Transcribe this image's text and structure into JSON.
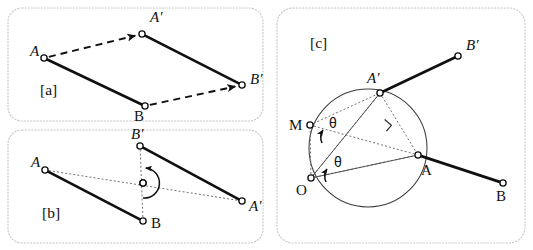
{
  "figure": {
    "background_color": "#ffffff",
    "line_color": "#101010",
    "frame_color": "#c8c8c8",
    "circle_color": "#3c3c3c"
  },
  "panels": [
    {
      "tag": "[a]",
      "name": "translation",
      "tag_pos": {
        "x": 40,
        "y": 95
      },
      "frame": {
        "x": 8,
        "y": 8,
        "width": 255,
        "height": 113,
        "rx": 14
      },
      "points": [
        {
          "id": "A",
          "label": "A",
          "x": 44,
          "y": 58,
          "label_x": 30,
          "label_y": 56,
          "italic": true
        },
        {
          "id": "Ap",
          "label": "A′",
          "x": 142,
          "y": 34,
          "label_x": 150,
          "label_y": 22,
          "italic": true
        },
        {
          "id": "B",
          "label": "B",
          "x": 145,
          "y": 106,
          "label_x": 134,
          "label_y": 121,
          "italic": false
        },
        {
          "id": "Bp",
          "label": "B′",
          "x": 242,
          "y": 85,
          "label_x": 250,
          "label_y": 84,
          "italic": true
        }
      ],
      "solid_segments": [
        [
          "A",
          "B"
        ],
        [
          "Ap",
          "Bp"
        ]
      ],
      "dashed_arrows": [
        [
          "A",
          "Ap"
        ],
        [
          "B",
          "Bp"
        ]
      ]
    },
    {
      "tag": "[b]",
      "name": "point-reflection",
      "tag_pos": {
        "x": 42,
        "y": 218
      },
      "frame": {
        "x": 8,
        "y": 130,
        "width": 255,
        "height": 113,
        "rx": 14
      },
      "points": [
        {
          "id": "A",
          "label": "A",
          "x": 45,
          "y": 170,
          "label_x": 31,
          "label_y": 167,
          "italic": true
        },
        {
          "id": "B",
          "label": "B",
          "x": 143,
          "y": 221,
          "label_x": 151,
          "label_y": 228,
          "italic": false
        },
        {
          "id": "Ap",
          "label": "A′",
          "x": 242,
          "y": 201,
          "label_x": 249,
          "label_y": 211,
          "italic": true
        },
        {
          "id": "Bp",
          "label": "B′",
          "x": 140,
          "y": 146,
          "label_x": 131,
          "label_y": 139,
          "italic": true
        },
        {
          "id": "O",
          "label": "",
          "x": 143,
          "y": 183,
          "label_x": 0,
          "label_y": 0,
          "italic": false
        }
      ],
      "solid_segments": [
        [
          "A",
          "B"
        ],
        [
          "Ap",
          "Bp"
        ]
      ],
      "dotted_lines": [
        [
          "A",
          "Ap"
        ],
        [
          "B",
          "Bp"
        ]
      ],
      "rotation_marker": {
        "center_x": 143,
        "center_y": 183,
        "radius": 15,
        "sweep_degrees": 180
      }
    },
    {
      "tag": "[c]",
      "name": "rotation-about-center",
      "tag_pos": {
        "x": 310,
        "y": 48
      },
      "frame": {
        "x": 277,
        "y": 8,
        "width": 248,
        "height": 235,
        "rx": 16
      },
      "points": [
        {
          "id": "O",
          "label": "O",
          "x": 311,
          "y": 178,
          "label_x": 296,
          "label_y": 195,
          "italic": false
        },
        {
          "id": "M",
          "label": "M",
          "x": 310,
          "y": 125,
          "label_x": 289,
          "label_y": 130,
          "italic": false
        },
        {
          "id": "Ap",
          "label": "A′",
          "x": 380,
          "y": 93,
          "label_x": 367,
          "label_y": 83,
          "italic": true
        },
        {
          "id": "A",
          "label": "A",
          "x": 418,
          "y": 155,
          "label_x": 421,
          "label_y": 175,
          "italic": false
        },
        {
          "id": "Bp",
          "label": "B′",
          "x": 458,
          "y": 56,
          "label_x": 466,
          "label_y": 50,
          "italic": true
        },
        {
          "id": "B",
          "label": "B",
          "x": 503,
          "y": 183,
          "label_x": 496,
          "label_y": 201,
          "italic": false
        }
      ],
      "solid_segments": [
        [
          "Ap",
          "Bp"
        ],
        [
          "A",
          "B"
        ]
      ],
      "thin_lines": [
        [
          "O",
          "Ap"
        ],
        [
          "O",
          "A"
        ]
      ],
      "dotted_lines": [
        [
          "O",
          "M"
        ],
        [
          "M",
          "Ap"
        ],
        [
          "Ap",
          "A"
        ],
        [
          "O",
          "Ap"
        ],
        [
          "O",
          "A"
        ],
        [
          "M",
          "A"
        ]
      ],
      "circle": {
        "cx": 368,
        "cy": 148,
        "r": 59
      },
      "right_angle_marker": {
        "x": 386,
        "y": 124,
        "size": 9
      },
      "angles": [
        {
          "label": "θ",
          "label_x": 329,
          "label_y": 128,
          "arrow_x": 322,
          "arrow_y": 134,
          "vertex": "M"
        },
        {
          "label": "θ",
          "label_x": 334,
          "label_y": 167,
          "arrow_x": 326,
          "arrow_y": 173,
          "vertex": "O"
        }
      ]
    }
  ],
  "labels": {
    "theta": "θ",
    "prime_mark": "′"
  }
}
